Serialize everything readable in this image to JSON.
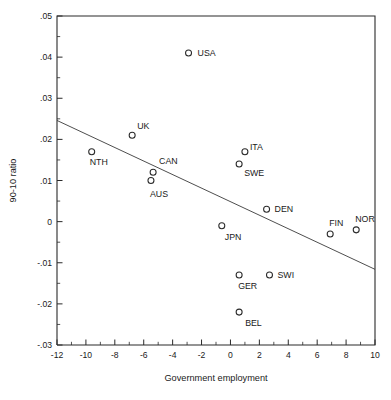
{
  "chart_data": {
    "type": "scatter",
    "title": "",
    "xlabel": "Government employment",
    "ylabel": "90-10 ratio",
    "xlim": [
      -12,
      10
    ],
    "ylim": [
      -0.03,
      0.05
    ],
    "xticks": [
      -12,
      -10,
      -8,
      -6,
      -4,
      -2,
      0,
      2,
      4,
      6,
      8,
      10
    ],
    "xticklabels": [
      "-12",
      "-10",
      "-8",
      "-6",
      "-4",
      "-2",
      "0",
      "2",
      "4",
      "6",
      "8",
      "10"
    ],
    "xminorticks": [
      -11,
      -9,
      -7,
      -5,
      -3,
      -1,
      1,
      3,
      5,
      7,
      9
    ],
    "yticks": [
      0.05,
      0.04,
      0.03,
      0.02,
      0.01,
      0,
      -0.01,
      -0.02,
      -0.03
    ],
    "yticklabels": [
      ".05",
      ".04",
      ".03",
      ".02",
      ".01",
      "0",
      "-.01",
      "-.02",
      "-.03"
    ],
    "yminorticks": [
      0.045,
      0.035,
      0.025,
      0.015,
      0.005,
      -0.005,
      -0.015,
      -0.025
    ],
    "grid": false,
    "legend": "none",
    "marker": "open-circle",
    "points": [
      {
        "label": "USA",
        "x": -2.9,
        "y": 0.041,
        "label_dx": 9,
        "label_dy": 3.2
      },
      {
        "label": "UK",
        "x": -6.8,
        "y": 0.021,
        "label_dx": 5,
        "label_dy": -6
      },
      {
        "label": "NTH",
        "x": -9.6,
        "y": 0.017,
        "label_dx": -2,
        "label_dy": 13
      },
      {
        "label": "CAN",
        "x": -5.35,
        "y": 0.012,
        "label_dx": 6,
        "label_dy": -8
      },
      {
        "label": "AUS",
        "x": -5.5,
        "y": 0.01,
        "label_dx": -1,
        "label_dy": 16
      },
      {
        "label": "ITA",
        "x": 1.0,
        "y": 0.017,
        "label_dx": 5,
        "label_dy": -2
      },
      {
        "label": "SWE",
        "x": 0.6,
        "y": 0.014,
        "label_dx": 5,
        "label_dy": 12
      },
      {
        "label": "DEN",
        "x": 2.5,
        "y": 0.003,
        "label_dx": 8,
        "label_dy": 3.2
      },
      {
        "label": "FIN",
        "x": 6.9,
        "y": -0.003,
        "label_dx": -1,
        "label_dy": -8
      },
      {
        "label": "NOR",
        "x": 8.7,
        "y": -0.002,
        "label_dx": -1,
        "label_dy": -8
      },
      {
        "label": "JPN",
        "x": -0.6,
        "y": -0.001,
        "label_dx": 3,
        "label_dy": 14
      },
      {
        "label": "GER",
        "x": 0.6,
        "y": -0.013,
        "label_dx": -1,
        "label_dy": 14
      },
      {
        "label": "SWI",
        "x": 2.7,
        "y": -0.013,
        "label_dx": 8,
        "label_dy": 3.2
      },
      {
        "label": "BEL",
        "x": 0.6,
        "y": -0.022,
        "label_dx": 6,
        "label_dy": 14
      }
    ],
    "fit_line": {
      "x0": -12,
      "y0": 0.0246,
      "x1": 10,
      "y1": -0.0116
    }
  },
  "colors": {
    "background": "#ffffff",
    "axis": "#2a2a2a",
    "marker": "#2a2a2a",
    "fit_line": "#3a3a3a",
    "text": "#1a1a1a"
  }
}
